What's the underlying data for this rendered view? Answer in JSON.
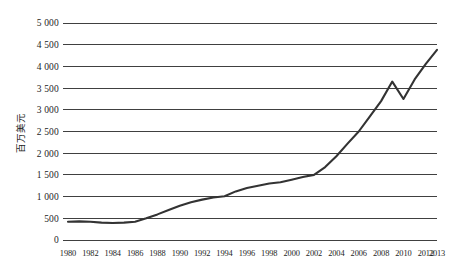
{
  "chart_data": {
    "type": "line",
    "title": "",
    "subtitle": "",
    "xlabel": "",
    "ylabel": "百万美元",
    "grid": true,
    "legend": false,
    "legend_position": "none",
    "xlim": [
      1980,
      2013
    ],
    "ylim": [
      0,
      5000
    ],
    "y_ticks": [
      0,
      500,
      1000,
      1500,
      2000,
      2500,
      3000,
      3500,
      4000,
      4500,
      5000
    ],
    "y_tick_labels": [
      "0",
      "500",
      "1 000",
      "1 500",
      "2 000",
      "2 500",
      "3 000",
      "3 500",
      "4 000",
      "4 500",
      "5 000"
    ],
    "x_ticks": [
      1980,
      1982,
      1984,
      1986,
      1988,
      1990,
      1992,
      1994,
      1996,
      1998,
      2000,
      2002,
      2004,
      2006,
      2008,
      2010,
      2012,
      2013
    ],
    "x_tick_labels": [
      "1980",
      "1982",
      "1984",
      "1986",
      "1988",
      "1990",
      "1992",
      "1994",
      "1996",
      "1998",
      "2000",
      "2002",
      "2004",
      "2006",
      "2008",
      "2010",
      "2012",
      "2013"
    ],
    "series": [
      {
        "name": "百万美元",
        "color": "#333333",
        "x": [
          1980,
          1981,
          1982,
          1983,
          1984,
          1985,
          1986,
          1987,
          1988,
          1989,
          1990,
          1991,
          1992,
          1993,
          1994,
          1995,
          1996,
          1997,
          1998,
          1999,
          2000,
          2001,
          2002,
          2003,
          2004,
          2005,
          2006,
          2007,
          2008,
          2009,
          2010,
          2011,
          2012,
          2013
        ],
        "values": [
          420,
          430,
          420,
          400,
          390,
          400,
          420,
          500,
          590,
          690,
          790,
          870,
          930,
          980,
          1010,
          1120,
          1200,
          1250,
          1300,
          1330,
          1390,
          1450,
          1500,
          1680,
          1930,
          2220,
          2500,
          2850,
          3200,
          3650,
          3250,
          3700,
          4060,
          4380
        ]
      }
    ],
    "annotations": []
  }
}
